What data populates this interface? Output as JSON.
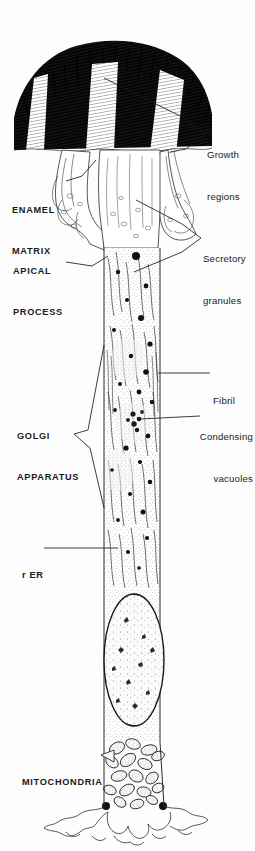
{
  "figure": {
    "style": "ink line drawing with stipple and hatching",
    "background_color": "#fdfdfd",
    "ink_color": "#1a1a1a"
  },
  "labels": {
    "growth_regions": {
      "line1": "Growth",
      "line2": "regions",
      "case": "lower",
      "side": "right"
    },
    "enamel_matrix": {
      "line1": "ENAMEL",
      "line2": "MATRIX",
      "case": "caps",
      "side": "left"
    },
    "apical_process": {
      "line1": "APICAL",
      "line2": "PROCESS",
      "case": "caps",
      "side": "left"
    },
    "secretory_granules": {
      "line1": "Secretory",
      "line2": "granules",
      "case": "lower",
      "side": "right"
    },
    "fibril": {
      "line1": "Fibril",
      "case": "lower",
      "side": "right"
    },
    "condensing_vacuoles": {
      "line1": "Condensing",
      "line2": "vacuoles",
      "case": "lower",
      "side": "right"
    },
    "golgi_apparatus": {
      "line1": "GOLGI",
      "line2": "APPARATUS",
      "case": "caps",
      "side": "left"
    },
    "rer": {
      "line1": "r ER",
      "case": "caps",
      "side": "left"
    },
    "mitochondria": {
      "line1": "MITOCHONDRIA",
      "case": "caps",
      "side": "left"
    }
  },
  "structures": [
    {
      "name": "enamel-matrix",
      "description": "dense black hatched matrix cap at top"
    },
    {
      "name": "growth-region",
      "description": "three pale vertical stripes within enamel matrix",
      "count": 3
    },
    {
      "name": "apical-process",
      "description": "Tomes process with finger-like projections"
    },
    {
      "name": "secretory-granule",
      "description": "solid black round granules",
      "count": 46
    },
    {
      "name": "fibril",
      "description": "longitudinal fibril bundles along cell edge"
    },
    {
      "name": "condensing-vacuole",
      "description": "small clustered vacuoles mid-cell"
    },
    {
      "name": "golgi-apparatus",
      "description": "stacked cisternae in supranuclear region"
    },
    {
      "name": "rough-endoplasmic-reticulum",
      "description": "parallel cisternae flanking nucleus"
    },
    {
      "name": "nucleus",
      "description": "elongated oval with marginal chromatin"
    },
    {
      "name": "mitochondria",
      "description": "cluster of oval mitochondria at cell base",
      "count": 22
    },
    {
      "name": "basal-process",
      "description": "wavy basal infoldings at bottom"
    }
  ]
}
